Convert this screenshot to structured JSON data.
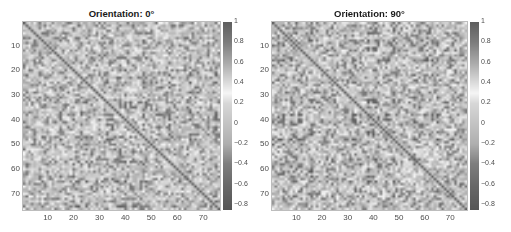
{
  "chart_data": [
    {
      "type": "heatmap",
      "title": "Orientation: 0°",
      "matrix_size": [
        76,
        76
      ],
      "xlabel": "",
      "ylabel": "",
      "x_ticks": [
        "10",
        "20",
        "30",
        "40",
        "50",
        "60",
        "70"
      ],
      "y_ticks": [
        "10",
        "20",
        "30",
        "40",
        "50",
        "60",
        "70"
      ],
      "x_range": [
        1,
        76
      ],
      "y_range": [
        1,
        76
      ],
      "diagonal_value": 1,
      "colorbar": {
        "range": [
          -0.85,
          1
        ],
        "ticks": [
          "1",
          "0.8",
          "0.6",
          "0.4",
          "0.2",
          "0",
          "-0.2",
          "-0.4",
          "-0.6",
          "-0.8"
        ]
      },
      "colormap": "gray-diverging (dark at extremes, white near 0.3)",
      "seed": 17,
      "block_band": [
        50,
        68
      ]
    },
    {
      "type": "heatmap",
      "title": "Orientation: 90°",
      "matrix_size": [
        76,
        76
      ],
      "xlabel": "",
      "ylabel": "",
      "x_ticks": [
        "10",
        "20",
        "30",
        "40",
        "50",
        "60",
        "70"
      ],
      "y_ticks": [
        "10",
        "20",
        "30",
        "40",
        "50",
        "60",
        "70"
      ],
      "x_range": [
        1,
        76
      ],
      "y_range": [
        1,
        76
      ],
      "diagonal_value": 1,
      "colorbar": {
        "range": [
          -0.85,
          1
        ],
        "ticks": [
          "1",
          "0.8",
          "0.6",
          "0.4",
          "0.2",
          "0",
          "-0.2",
          "-0.4",
          "-0.6",
          "-0.8"
        ]
      },
      "colormap": "gray-diverging (dark at extremes, white near 0.3)",
      "seed": 91,
      "block_band": [
        48,
        66
      ]
    }
  ]
}
